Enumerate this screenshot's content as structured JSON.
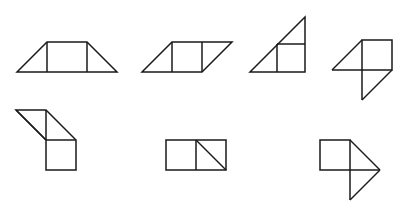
{
  "canvas": {
    "width": 402,
    "height": 208,
    "background_color": "#ffffff",
    "stroke_color": "#1a1a1a",
    "stroke_width": 1.5,
    "description": "Seven line-drawn geometric figures composed of unit squares and right triangles, arranged in two rows on a plain white background"
  },
  "figures": [
    {
      "id": "figure-1",
      "name": "trapezoid-with-central-square",
      "row": 1,
      "position": 1,
      "label": "Trapezoid with central square",
      "pieces": "2 right triangles + 1 square",
      "outline": "17,72 47,42 87,42 117,72",
      "closed": true,
      "segments": [
        "47,42 47,72",
        "87,42 87,72"
      ]
    },
    {
      "id": "figure-2",
      "name": "parallelogram-with-central-square",
      "row": 1,
      "position": 2,
      "label": "Parallelogram with central square",
      "pieces": "2 right triangles + 1 square",
      "outline": "142,72 172,42 232,42 202,72",
      "closed": true,
      "segments": [
        "172,42 172,72",
        "202,42 202,72"
      ]
    },
    {
      "id": "figure-3",
      "name": "right-triangle-with-inscribed-square",
      "row": 1,
      "position": 3,
      "label": "Right triangle with inscribed square",
      "pieces": "2 right triangles + 1 square",
      "outline": "250,72 305,17 305,72",
      "closed": true,
      "segments": [
        "277,44 305,44",
        "277,44 277,72"
      ]
    },
    {
      "id": "figure-4",
      "name": "square-with-two-triangles-stepped",
      "row": 1,
      "position": 4,
      "label": "Square with upper-left and lower-right triangles",
      "pieces": "2 right triangles + 1 square",
      "outline": "362,40 392,40 392,70 362,70",
      "closed": true,
      "segments": [
        "362,40 332,70",
        "332,70 362,70",
        "362,70 362,100",
        "362,100 392,70"
      ]
    },
    {
      "id": "figure-5",
      "name": "parallelogram-above-square",
      "row": 2,
      "position": 1,
      "label": "Parallelogram above square",
      "pieces": "2 right triangles + 1 square",
      "outline": "16,110 46,110 76,140 76,170 46,170 46,140",
      "closed": true,
      "segments": [
        "16,110 46,140",
        "46,110 46,140",
        "46,140 76,140"
      ]
    },
    {
      "id": "figure-6",
      "name": "two-squares-with-diagonal",
      "row": 2,
      "position": 2,
      "label": "Two squares, right one split by a diagonal",
      "pieces": "2 right triangles + 1 square",
      "outline": "166,140 226,140 226,170 166,170",
      "closed": true,
      "segments": [
        "196,140 196,170",
        "196,140 226,170"
      ]
    },
    {
      "id": "figure-7",
      "name": "square-with-right-pointing-triangles",
      "row": 2,
      "position": 3,
      "label": "Square with right-pointing triangle and lower triangle",
      "pieces": "2 right triangles + 1 square",
      "outline": "320,140 350,140 350,170 320,170",
      "closed": true,
      "segments": [
        "350,140 380,170",
        "350,170 380,170",
        "350,170 350,200",
        "350,200 380,170"
      ]
    }
  ]
}
